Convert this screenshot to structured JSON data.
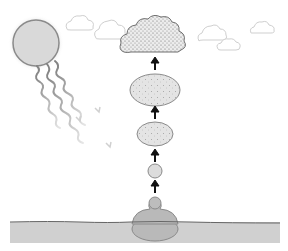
{
  "diagram": {
    "type": "evaporation-process",
    "labels": [],
    "colors": {
      "background": "#ffffff",
      "sun_fill": "#d9d9d9",
      "sun_stroke": "#8a8a8a",
      "ray": "#8c8c8c",
      "cloud_light_stroke": "#cfcfcf",
      "cloud_dark_fill": "#e6e6e6",
      "cloud_dark_stroke": "#6e6e6e",
      "droplet_fill": "#e0e0e0",
      "droplet_stroke": "#8a8a8a",
      "arrow": "#111111",
      "water_fill": "#cfcfcf",
      "water_line": "#666666",
      "blob_fill": "#b8b8b8"
    },
    "elements": {
      "sun": {
        "cx": 36,
        "cy": 43,
        "r": 23
      },
      "rays_count": 3,
      "light_clouds_count": 5,
      "dark_cloud": {
        "x": 120,
        "y": 13,
        "w": 67,
        "h": 42
      },
      "rising_stages": [
        {
          "shape": "ellipse",
          "cx": 155,
          "cy": 90,
          "rx": 25,
          "ry": 16,
          "dotted": true
        },
        {
          "shape": "ellipse",
          "cx": 155,
          "cy": 134,
          "rx": 18,
          "ry": 12,
          "dotted": true
        },
        {
          "shape": "circle",
          "cx": 155,
          "cy": 171,
          "r": 7,
          "dotted": false
        },
        {
          "shape": "circle",
          "cx": 155,
          "cy": 203,
          "r": 6,
          "dotted": false
        }
      ],
      "arrows_count": 4,
      "water_surface": {
        "x": 10,
        "y": 222,
        "w": 270,
        "h": 21
      }
    }
  }
}
